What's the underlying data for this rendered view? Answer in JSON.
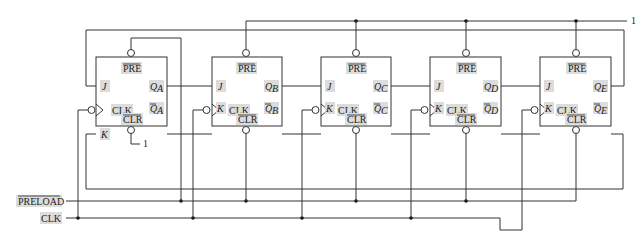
{
  "diagram": {
    "inputs": {
      "preload_label": "PRELOAD",
      "clk_label": "CLK",
      "logic_one_top": "1",
      "logic_one_clr_a": "1"
    },
    "flip_flops": [
      {
        "id": "A",
        "pre": "PRE",
        "j": "J",
        "clk": "CLK",
        "k": "K",
        "clr": "CLR",
        "q": "Q",
        "q_sub": "A",
        "qbar": "Q",
        "qbar_sub": "A"
      },
      {
        "id": "B",
        "pre": "PRE",
        "j": "J",
        "clk": "CLK",
        "k": "K",
        "clr": "CLR",
        "q": "Q",
        "q_sub": "B",
        "qbar": "Q",
        "qbar_sub": "B"
      },
      {
        "id": "C",
        "pre": "PRE",
        "j": "J",
        "clk": "CLK",
        "k": "K",
        "clr": "CLR",
        "q": "Q",
        "q_sub": "C",
        "qbar": "Q",
        "qbar_sub": "C"
      },
      {
        "id": "D",
        "pre": "PRE",
        "j": "J",
        "clk": "CLK",
        "k": "K",
        "clr": "CLR",
        "q": "Q",
        "q_sub": "D",
        "qbar": "Q",
        "qbar_sub": "D"
      },
      {
        "id": "E",
        "pre": "PRE",
        "j": "J",
        "clk": "CLK",
        "k": "K",
        "clr": "CLR",
        "q": "Q",
        "q_sub": "E",
        "qbar": "Q",
        "qbar_sub": "E"
      }
    ],
    "connections": {
      "pre_A": "Q_E feedback loop",
      "pre_B_to_E": "logic 1",
      "clr_A": "logic 1",
      "clr_B_to_E": "PRELOAD",
      "clk_all": "CLK (inverted bubble)",
      "j_A": "Q_E",
      "k_A": "Qbar_E"
    }
  }
}
